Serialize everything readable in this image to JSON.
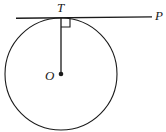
{
  "figure": {
    "type": "geometry-diagram",
    "width": 166,
    "height": 132,
    "background_color": "#ffffff",
    "stroke_color": "#1a1a1a",
    "labels": {
      "center": "O",
      "tangent_point": "T",
      "tangent_end": "P"
    },
    "geometry": {
      "circle": {
        "cx": 61,
        "cy": 74,
        "r": 56
      },
      "center_dot": {
        "cx": 61,
        "cy": 74,
        "r": 2.2
      },
      "radius_segment": {
        "x1": 61,
        "y1": 18,
        "x2": 61,
        "y2": 74
      },
      "tangent_line": {
        "x1": 16,
        "y1": 18,
        "x2": 152,
        "y2": 17
      },
      "right_angle_marker": {
        "x": 61,
        "y": 18,
        "size": 9
      }
    }
  }
}
